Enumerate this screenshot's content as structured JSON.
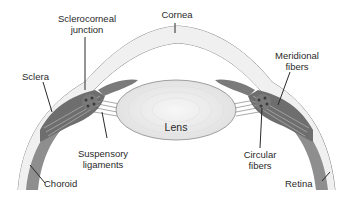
{
  "diagram": {
    "labels": {
      "cornea": "Cornea",
      "sclerocorneal_junction_line1": "Sclerocorneal",
      "sclerocorneal_junction_line2": "junction",
      "sclera": "Sclera",
      "meridional_fibers_line1": "Meridional",
      "meridional_fibers_line2": "fibers",
      "lens": "Lens",
      "suspensory_ligaments_line1": "Suspensory",
      "suspensory_ligaments_line2": "ligaments",
      "circular_fibers_line1": "Circular",
      "circular_fibers_line2": "fibers",
      "choroid": "Choroid",
      "retina": "Retina"
    },
    "colors": {
      "sclera_fill": "#f0f0f0",
      "outline": "#8a8a8a",
      "muscle_dark": "#6e6e6e",
      "muscle_mid": "#9a9a9a",
      "lens_fill": "#ececec",
      "text": "#2a2a2a"
    }
  }
}
